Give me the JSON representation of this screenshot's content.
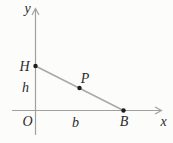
{
  "figure": {
    "type": "coordinate-geometry-diagram",
    "background": "#fcfcfb",
    "axis_color": "#a0a0a0",
    "segment_color": "#a8a8a8",
    "point_color": "#1c1c1c",
    "text_color": "#2a2a2a",
    "axes": {
      "x_label": "x",
      "y_label": "y",
      "origin_label": "O",
      "x_axis": {
        "y": 110.5,
        "x_start": 12,
        "x_end": 161.5
      },
      "y_axis": {
        "x": 35.5,
        "y_start": 135,
        "y_end": 8.5
      },
      "x_label_pos": {
        "x": 163.5,
        "y": 126
      },
      "y_label_pos": {
        "x": 27.5,
        "y": 13
      },
      "origin_label_pos": {
        "x": 27.5,
        "y": 125.5
      }
    },
    "segment": {
      "from": "H",
      "to": "B"
    },
    "points": [
      {
        "label": "H",
        "x": 35.5,
        "y": 66,
        "label_x": 24.5,
        "label_y": 71
      },
      {
        "label": "P",
        "x": 79.5,
        "y": 88,
        "label_x": 85,
        "label_y": 82.5
      },
      {
        "label": "B",
        "x": 123.5,
        "y": 110.5,
        "label_x": 124,
        "label_y": 125.5
      }
    ],
    "measure_labels": [
      {
        "label": "h",
        "x": 25.5,
        "y": 92
      },
      {
        "label": "b",
        "x": 75.5,
        "y": 127
      }
    ]
  }
}
